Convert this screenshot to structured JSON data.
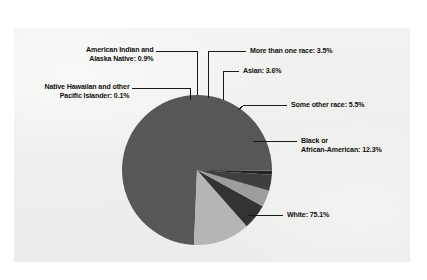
{
  "figure": {
    "background_color": "#ffffff",
    "panel_color": "#ededeb",
    "text_color": "#100f0d",
    "leader_color": "#1a1a18"
  },
  "chart_data": {
    "type": "pie",
    "title": "",
    "xlabel": "",
    "ylabel": "",
    "units": "percent",
    "start_angle_deg": 0,
    "direction": "counterclockwise",
    "legend": "none (direct labels with leader lines)",
    "grid": false,
    "categories": [
      "White",
      "Black or African-American",
      "Some other race",
      "Asian",
      "More than one race",
      "American Indian and Alaska Native",
      "Native Hawaiian and other Pacific Islander"
    ],
    "values": [
      75.1,
      12.3,
      5.5,
      3.6,
      3.5,
      0.9,
      0.1
    ],
    "colors": [
      "#575757",
      "#b5b5b5",
      "#333333",
      "#9d9d9d",
      "#3f3f3f",
      "#222222",
      "#6e6e6e"
    ],
    "labels": [
      "White: 75.1%",
      "Black or African-American: 12.3%",
      "Some other race: 5.5%",
      "Asian: 3.6%",
      "More than one race: 3.5%",
      "American Indian and Alaska Native: 0.9%",
      "Native Hawaiian and other Pacific Islander: 0.1%"
    ]
  },
  "labels": {
    "american_indian_line1": "American Indian and",
    "american_indian_line2": "Alaska Native: 0.9%",
    "native_hawaiian_line1": "Native Hawaiian and other",
    "native_hawaiian_line2": "Pacific Islander: 0.1%",
    "more_than_one_race": "More than one race: 3.5%",
    "asian": "Asian: 3.6%",
    "some_other_race": "Some other race: 5.5%",
    "black_line1": "Black or",
    "black_line2": "African-American: 12.3%",
    "white": "White: 75.1%"
  }
}
